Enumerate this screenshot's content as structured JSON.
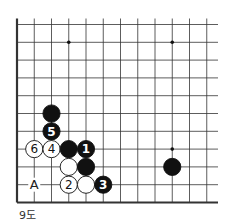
{
  "diagram": {
    "caption": "9도",
    "grid": {
      "x0": 17,
      "dx": 17.25,
      "cols": 12,
      "x_extend": 218,
      "y0": 24.5,
      "dy": 17.8,
      "rows": 11,
      "edge_left": true,
      "edge_bottom": true
    },
    "star_points": [
      [
        3,
        1
      ],
      [
        9,
        1
      ],
      [
        9,
        7
      ]
    ],
    "stones": [
      {
        "col": 2,
        "row": 5,
        "color": "black",
        "label": ""
      },
      {
        "col": 2,
        "row": 6,
        "color": "black",
        "label": "5"
      },
      {
        "col": 1,
        "row": 7,
        "color": "white",
        "label": "6"
      },
      {
        "col": 2,
        "row": 7,
        "color": "white",
        "label": "4"
      },
      {
        "col": 3,
        "row": 7,
        "color": "black",
        "label": ""
      },
      {
        "col": 4,
        "row": 7,
        "color": "black",
        "label": "1"
      },
      {
        "col": 3,
        "row": 8,
        "color": "white",
        "label": ""
      },
      {
        "col": 4,
        "row": 8,
        "color": "black",
        "label": ""
      },
      {
        "col": 3,
        "row": 9,
        "color": "white",
        "label": "2"
      },
      {
        "col": 4,
        "row": 9,
        "color": "white",
        "label": ""
      },
      {
        "col": 5,
        "row": 9,
        "color": "black",
        "label": "3"
      },
      {
        "col": 9,
        "row": 8,
        "color": "black",
        "label": ""
      }
    ],
    "markers": [
      {
        "col": 1,
        "row": 9,
        "label": "A"
      }
    ],
    "colors": {
      "line": "#333333",
      "black": "#111111",
      "white": "#ffffff"
    }
  }
}
